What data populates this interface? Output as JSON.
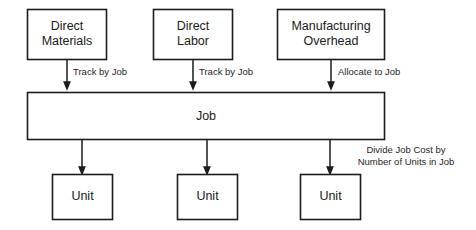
{
  "diagram": {
    "colors": {
      "background": "#ffffff",
      "stroke": "#1c1c1c",
      "text": "#1a1a1a",
      "box_fill": "#ffffff"
    },
    "source_boxes": [
      {
        "id": "direct-materials",
        "line1": "Direct",
        "line2": "Materials"
      },
      {
        "id": "direct-labor",
        "line1": "Direct",
        "line2": "Labor"
      },
      {
        "id": "manufacturing-overhead",
        "line1": "Manufacturing",
        "line2": "Overhead"
      }
    ],
    "edge_labels": [
      {
        "id": "materials-to-job",
        "text": "Track by Job"
      },
      {
        "id": "labor-to-job",
        "text": "Track by Job"
      },
      {
        "id": "overhead-to-job",
        "text": "Allocate to Job"
      }
    ],
    "job_box": {
      "id": "job",
      "label": "Job"
    },
    "unit_boxes": [
      {
        "id": "unit-1",
        "label": "Unit"
      },
      {
        "id": "unit-2",
        "label": "Unit"
      },
      {
        "id": "unit-3",
        "label": "Unit"
      }
    ],
    "note": {
      "id": "divide-note",
      "line1": "Divide Job Cost by",
      "line2": "Number of Units in Job"
    }
  }
}
